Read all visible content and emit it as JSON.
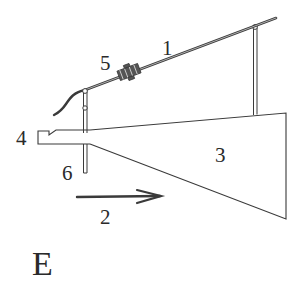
{
  "figure": {
    "label": "E",
    "ink_color": "#3a3a3a",
    "background": "#ffffff"
  },
  "parts": [
    {
      "id": "1",
      "label": "1",
      "description": "inclined rod"
    },
    {
      "id": "2",
      "label": "2",
      "description": "direction arrow"
    },
    {
      "id": "3",
      "label": "3",
      "description": "tapered plate"
    },
    {
      "id": "4",
      "label": "4",
      "description": "notched front piece"
    },
    {
      "id": "5",
      "label": "5",
      "description": "clamp on rod"
    },
    {
      "id": "6",
      "label": "6",
      "description": "vertical post"
    }
  ],
  "labels": {
    "part1": "1",
    "part2": "2",
    "part3": "3",
    "part4": "4",
    "part5": "5",
    "part6": "6",
    "figure": "E"
  }
}
